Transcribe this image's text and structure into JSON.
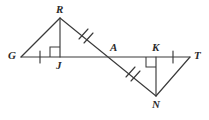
{
  "figure": {
    "width": 209,
    "height": 120,
    "background_color": "#ffffff",
    "stroke_color": "#3a3a3a",
    "label_color": "#2b2b2b",
    "points": {
      "G": {
        "label": "G",
        "x": 21,
        "y": 57,
        "label_x": 8,
        "label_y": 50
      },
      "J": {
        "label": "J",
        "x": 60,
        "y": 57,
        "label_x": 56,
        "label_y": 60
      },
      "R": {
        "label": "R",
        "x": 60,
        "y": 18,
        "label_x": 56,
        "label_y": 4
      },
      "A": {
        "label": "A",
        "x": 114,
        "y": 57,
        "label_x": 110,
        "label_y": 42
      },
      "K": {
        "label": "K",
        "x": 156,
        "y": 57,
        "label_x": 152,
        "label_y": 42
      },
      "T": {
        "label": "T",
        "x": 190,
        "y": 57,
        "label_x": 194,
        "label_y": 50
      },
      "N": {
        "label": "N",
        "x": 156,
        "y": 96,
        "label_x": 152,
        "label_y": 99
      }
    },
    "segments": [
      {
        "name": "segment-GT",
        "from": "G",
        "to": "T",
        "description": "horizontal base line through G, J, A, K, T"
      },
      {
        "name": "segment-RN",
        "from": "R",
        "to": "N",
        "description": "transversal through A"
      },
      {
        "name": "segment-GR",
        "from": "G",
        "to": "R",
        "description": "hypotenuse of left triangle"
      },
      {
        "name": "segment-RJ",
        "from": "R",
        "to": "J",
        "description": "vertical leg of left triangle"
      },
      {
        "name": "segment-NK",
        "from": "N",
        "to": "K",
        "description": "vertical leg of right triangle"
      },
      {
        "name": "segment-NT",
        "from": "N",
        "to": "T",
        "description": "hypotenuse of right triangle"
      }
    ],
    "tick_marks": [
      {
        "name": "tick-GJ",
        "segment": "GJ",
        "count": 1,
        "style": "single",
        "x": 40,
        "y": 57
      },
      {
        "name": "tick-KT",
        "segment": "KT",
        "count": 1,
        "style": "single",
        "x": 173,
        "y": 57
      },
      {
        "name": "tick-RA",
        "segment": "RA",
        "count": 2,
        "style": "double",
        "x": 85,
        "y": 37
      },
      {
        "name": "tick-AN",
        "segment": "AN",
        "count": 2,
        "style": "double",
        "x": 133,
        "y": 75
      }
    ],
    "right_angles": [
      {
        "name": "right-angle-J",
        "vertex": "J",
        "at_x": 60,
        "at_y": 57,
        "opens": "up-left"
      },
      {
        "name": "right-angle-K",
        "vertex": "K",
        "at_x": 156,
        "at_y": 57,
        "opens": "down-left"
      }
    ]
  }
}
